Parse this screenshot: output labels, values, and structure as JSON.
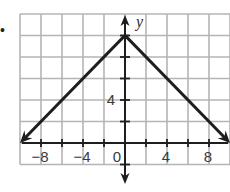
{
  "problem_marker": "•",
  "chart_data": {
    "type": "line",
    "title": "",
    "function": "y = -|x| + 10",
    "xlabel": "",
    "ylabel": "y",
    "xlim": [
      -10,
      10
    ],
    "ylim": [
      -2,
      12
    ],
    "grid": true,
    "grid_step": 2,
    "x_ticks": [
      -8,
      -4,
      0,
      4,
      8
    ],
    "x_tick_labels": [
      "−8",
      "−4",
      "0",
      "4",
      "8"
    ],
    "y_ticks": [
      4
    ],
    "y_tick_labels": [
      "4"
    ],
    "series": [
      {
        "name": "graph",
        "x": [
          -10,
          0,
          10
        ],
        "y": [
          0,
          10,
          0
        ],
        "arrows": "both ends"
      }
    ],
    "vertex": [
      0,
      10
    ],
    "colors": {
      "line": "#1e1e1e",
      "grid": "#b5b5b5",
      "axis": "#1e1e1e"
    }
  }
}
